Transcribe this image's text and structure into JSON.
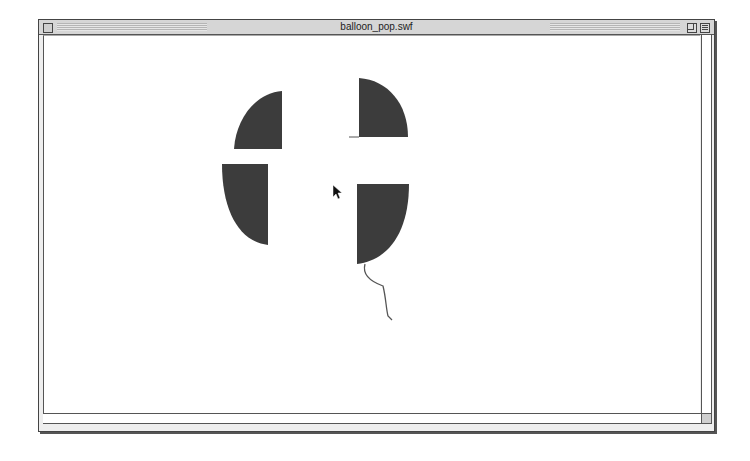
{
  "window": {
    "title": "balloon_pop.swf",
    "controls": [
      "close-box",
      "zoom-box",
      "collapse-box"
    ]
  },
  "stage": {
    "background": "#ffffff",
    "balloon_color": "#3c3c3c",
    "string_color": "#555555",
    "pieces": [
      {
        "name": "balloon-piece-top-left",
        "quadrant": "top-left"
      },
      {
        "name": "balloon-piece-bottom-left",
        "quadrant": "bottom-left"
      },
      {
        "name": "balloon-piece-top-right",
        "quadrant": "top-right"
      },
      {
        "name": "balloon-piece-bottom-right",
        "quadrant": "bottom-right"
      }
    ],
    "cursor": "arrow-pointer"
  }
}
